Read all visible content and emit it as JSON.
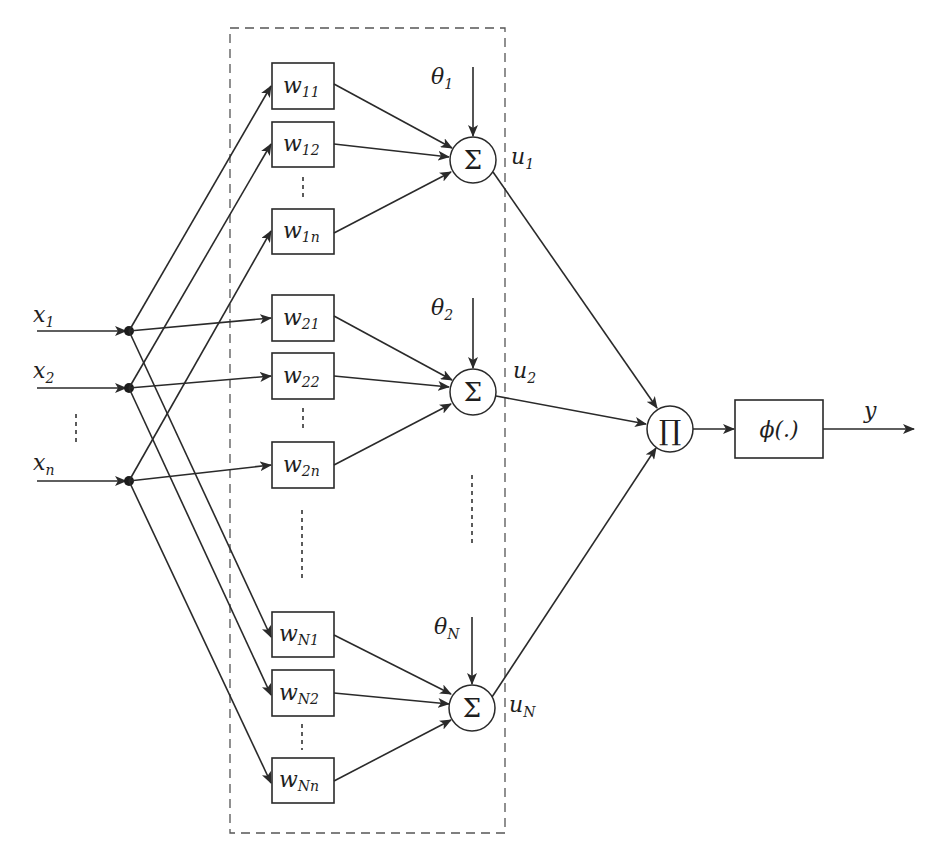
{
  "diagram": {
    "type": "neural-network-block-diagram",
    "inputs": [
      {
        "base": "x",
        "sub": "1"
      },
      {
        "base": "x",
        "sub": "2"
      },
      {
        "base": "x",
        "sub": "n"
      }
    ],
    "input_ellipsis": "⋮",
    "groups": [
      {
        "weights": [
          {
            "base": "w",
            "sub": "11"
          },
          {
            "base": "w",
            "sub": "12"
          },
          {
            "base": "w",
            "sub": "1n"
          }
        ],
        "bias": {
          "base": "θ",
          "sub": "1"
        },
        "sum_symbol": "Σ",
        "output": {
          "base": "u",
          "sub": "1"
        }
      },
      {
        "weights": [
          {
            "base": "w",
            "sub": "21"
          },
          {
            "base": "w",
            "sub": "22"
          },
          {
            "base": "w",
            "sub": "2n"
          }
        ],
        "bias": {
          "base": "θ",
          "sub": "2"
        },
        "sum_symbol": "Σ",
        "output": {
          "base": "u",
          "sub": "2"
        }
      },
      {
        "weights": [
          {
            "base": "w",
            "sub": "N1"
          },
          {
            "base": "w",
            "sub": "N2"
          },
          {
            "base": "w",
            "sub": "Nn"
          }
        ],
        "bias": {
          "base": "θ",
          "sub": "N"
        },
        "sum_symbol": "Σ",
        "output": {
          "base": "u",
          "sub": "N"
        }
      }
    ],
    "product_symbol": "∏",
    "activation": {
      "label": "ϕ(.)"
    },
    "output": {
      "label": "y"
    }
  }
}
